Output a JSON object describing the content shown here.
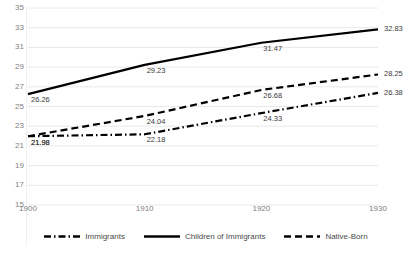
{
  "chart_data": {
    "type": "line",
    "title": "",
    "subtitle": "",
    "xlabel": "",
    "ylabel": "",
    "x": [
      1900,
      1910,
      1920,
      1930
    ],
    "categories": [
      "1900",
      "1910",
      "1920",
      "1930"
    ],
    "xtick_labels": [
      "1900",
      "1910",
      "1920",
      "1930"
    ],
    "ytick_labels": [
      "35",
      "33",
      "31",
      "29",
      "27",
      "25",
      "23",
      "21",
      "19",
      "17",
      "15"
    ],
    "ytick_values": [
      35,
      33,
      31,
      29,
      27,
      25,
      23,
      21,
      19,
      17,
      15
    ],
    "ylim": [
      15,
      35
    ],
    "xlim": [
      1900,
      1930
    ],
    "grid": true,
    "grid_axis": "y",
    "grid_color": "#e8e8e8",
    "legend_position": "bottom",
    "series": [
      {
        "name": "Immigrants",
        "style": "dash-dot",
        "color": "#000000",
        "values": [
          21.98,
          22.18,
          24.33,
          26.38
        ],
        "labels": [
          "21.98",
          "22.18",
          "24.33",
          "26.38"
        ]
      },
      {
        "name": "Children of Immigrants",
        "style": "solid",
        "color": "#000000",
        "values": [
          26.26,
          29.23,
          31.47,
          32.83
        ],
        "labels": [
          "26.26",
          "29.23",
          "31.47",
          "32.83"
        ]
      },
      {
        "name": "Native-Born",
        "style": "dashed",
        "color": "#000000",
        "values": [
          21.98,
          24.04,
          26.68,
          28.25
        ],
        "labels": [
          "21.98",
          "24.04",
          "26.68",
          "28.25"
        ]
      }
    ]
  },
  "legend": {
    "items": [
      {
        "label": "Immigrants",
        "style": "dash-dot"
      },
      {
        "label": "Children of Immigrants",
        "style": "solid"
      },
      {
        "label": "Native-Born",
        "style": "dashed"
      }
    ]
  },
  "axes": {
    "y_labels": [
      "35",
      "33",
      "31",
      "29",
      "27",
      "25",
      "23",
      "21",
      "19",
      "17",
      "15"
    ],
    "x_labels": [
      "1900",
      "1910",
      "1920",
      "1930"
    ]
  }
}
